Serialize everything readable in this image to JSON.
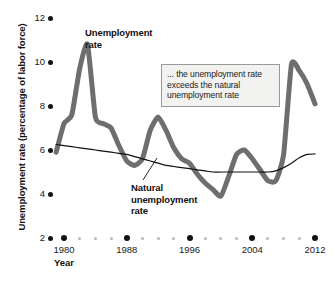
{
  "chart_data": {
    "type": "line",
    "title": "",
    "xlabel": "Year",
    "ylabel": "Unemployment rate (percentage of labor force)",
    "xlim": [
      1980,
      2012
    ],
    "ylim": [
      2,
      12
    ],
    "grid": false,
    "legend_position": "inline-annotations",
    "y_ticks": [
      2,
      4,
      6,
      8,
      10,
      12
    ],
    "y_tick_labels": [
      "2",
      "4",
      "6",
      "8",
      "10",
      "12"
    ],
    "x_ticks": [
      1980,
      1988,
      1996,
      2004,
      2012
    ],
    "x_tick_labels": [
      "1980",
      "1988",
      "1996",
      "2004",
      "2012"
    ],
    "x_minor_tick_step": 2,
    "x": [
      1979,
      1980,
      1981,
      1982,
      1983,
      1984,
      1985,
      1986,
      1987,
      1988,
      1989,
      1990,
      1991,
      1992,
      1993,
      1994,
      1995,
      1996,
      1997,
      1998,
      1999,
      2000,
      2001,
      2002,
      2003,
      2004,
      2005,
      2006,
      2007,
      2008,
      2009,
      2010,
      2011,
      2012
    ],
    "series": [
      {
        "name": "Unemployment rate",
        "color": "#6e6e6e",
        "width": 5,
        "values": [
          5.9,
          7.2,
          7.6,
          9.7,
          10.8,
          7.5,
          7.2,
          7.0,
          6.2,
          5.5,
          5.3,
          5.6,
          6.9,
          7.5,
          6.9,
          6.1,
          5.6,
          5.4,
          4.9,
          4.5,
          4.2,
          3.9,
          4.8,
          5.8,
          6.0,
          5.6,
          5.1,
          4.6,
          4.6,
          5.8,
          9.9,
          9.6,
          9.0,
          8.1
        ]
      },
      {
        "name": "Natural unemployment rate",
        "color": "#111111",
        "width": 1.2,
        "values": [
          6.25,
          6.2,
          6.15,
          6.1,
          6.05,
          6.0,
          5.95,
          5.9,
          5.85,
          5.8,
          5.7,
          5.6,
          5.5,
          5.4,
          5.3,
          5.25,
          5.2,
          5.15,
          5.1,
          5.05,
          5.0,
          5.0,
          5.0,
          5.0,
          5.0,
          5.0,
          5.0,
          5.0,
          5.05,
          5.2,
          5.4,
          5.65,
          5.8,
          5.82
        ]
      }
    ],
    "annotations": [
      {
        "name": "callout",
        "text": "... the unemployment rate exceeds the natural unemployment rate"
      },
      {
        "name": "unemployment-rate-label",
        "text": "Unemployment\nrate"
      },
      {
        "name": "natural-rate-label",
        "text": "Natural\nunemployment\nrate"
      }
    ]
  },
  "axes": {
    "y_title": "Unemployment rate (percentage of labor force)",
    "x_title": "Year",
    "y_labels": [
      "12",
      "10",
      "8",
      "6",
      "4",
      "2"
    ],
    "x_labels": [
      "1980",
      "1988",
      "1996",
      "2004",
      "2012"
    ]
  },
  "labels": {
    "unemployment_rate_line1": "Unemployment",
    "unemployment_rate_line2": "rate",
    "natural_rate_line1": "Natural",
    "natural_rate_line2": "unemployment",
    "natural_rate_line3": "rate"
  },
  "callout": {
    "line1": "... the unemployment",
    "line2": "rate exceeds the natural",
    "line3": "unemployment rate"
  },
  "colors": {
    "unemployment_line": "#6e6e6e",
    "natural_line": "#111111",
    "text": "#111111",
    "callout_bg": "#f2f2f0",
    "callout_border": "#9a9a9a",
    "minor_tick": "#b8b8b8"
  }
}
